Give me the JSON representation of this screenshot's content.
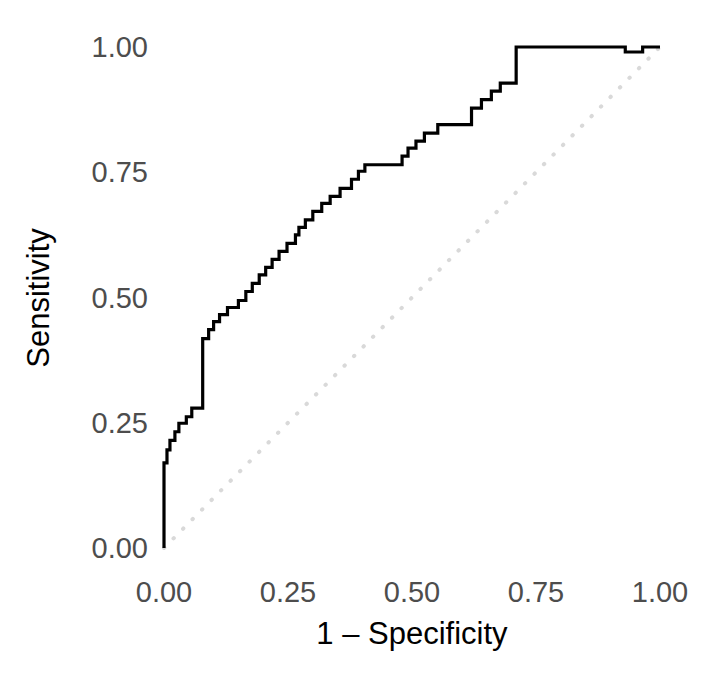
{
  "chart_data": {
    "type": "line",
    "title": "",
    "subtitle": "",
    "xlabel": "1 – Specificity",
    "ylabel": "Sensitivity",
    "xlim": [
      0,
      1
    ],
    "ylim": [
      0,
      1
    ],
    "grid": false,
    "legend": null,
    "xticks": [
      "0.00",
      "0.25",
      "0.50",
      "0.75",
      "1.00"
    ],
    "xtick_values": [
      0.0,
      0.25,
      0.5,
      0.75,
      1.0
    ],
    "yticks": [
      "0.00",
      "0.25",
      "0.50",
      "0.75",
      "1.00"
    ],
    "ytick_values": [
      0.0,
      0.25,
      0.5,
      0.75,
      1.0
    ],
    "annotations": [],
    "series": [
      {
        "name": "ROC curve",
        "style": "step",
        "color": "#000000",
        "linewidth": 3.2,
        "dash": "solid",
        "points": [
          [
            0.0,
            0.0
          ],
          [
            0.0,
            0.17
          ],
          [
            0.006,
            0.17
          ],
          [
            0.006,
            0.196
          ],
          [
            0.012,
            0.196
          ],
          [
            0.012,
            0.215
          ],
          [
            0.022,
            0.215
          ],
          [
            0.022,
            0.232
          ],
          [
            0.03,
            0.232
          ],
          [
            0.03,
            0.249
          ],
          [
            0.045,
            0.249
          ],
          [
            0.045,
            0.262
          ],
          [
            0.056,
            0.262
          ],
          [
            0.056,
            0.279
          ],
          [
            0.078,
            0.279
          ],
          [
            0.078,
            0.418
          ],
          [
            0.09,
            0.418
          ],
          [
            0.09,
            0.436
          ],
          [
            0.1,
            0.436
          ],
          [
            0.1,
            0.452
          ],
          [
            0.112,
            0.452
          ],
          [
            0.112,
            0.466
          ],
          [
            0.128,
            0.466
          ],
          [
            0.128,
            0.48
          ],
          [
            0.15,
            0.48
          ],
          [
            0.15,
            0.494
          ],
          [
            0.165,
            0.494
          ],
          [
            0.165,
            0.512
          ],
          [
            0.178,
            0.512
          ],
          [
            0.178,
            0.528
          ],
          [
            0.192,
            0.528
          ],
          [
            0.192,
            0.545
          ],
          [
            0.205,
            0.545
          ],
          [
            0.205,
            0.56
          ],
          [
            0.218,
            0.56
          ],
          [
            0.218,
            0.576
          ],
          [
            0.232,
            0.576
          ],
          [
            0.232,
            0.592
          ],
          [
            0.248,
            0.592
          ],
          [
            0.248,
            0.608
          ],
          [
            0.265,
            0.608
          ],
          [
            0.265,
            0.625
          ],
          [
            0.272,
            0.625
          ],
          [
            0.272,
            0.64
          ],
          [
            0.285,
            0.64
          ],
          [
            0.285,
            0.655
          ],
          [
            0.3,
            0.655
          ],
          [
            0.3,
            0.672
          ],
          [
            0.318,
            0.672
          ],
          [
            0.318,
            0.688
          ],
          [
            0.335,
            0.688
          ],
          [
            0.335,
            0.702
          ],
          [
            0.355,
            0.702
          ],
          [
            0.355,
            0.718
          ],
          [
            0.378,
            0.718
          ],
          [
            0.378,
            0.736
          ],
          [
            0.392,
            0.736
          ],
          [
            0.392,
            0.752
          ],
          [
            0.405,
            0.752
          ],
          [
            0.405,
            0.765
          ],
          [
            0.48,
            0.765
          ],
          [
            0.48,
            0.782
          ],
          [
            0.492,
            0.782
          ],
          [
            0.492,
            0.798
          ],
          [
            0.508,
            0.798
          ],
          [
            0.508,
            0.812
          ],
          [
            0.525,
            0.812
          ],
          [
            0.525,
            0.828
          ],
          [
            0.552,
            0.828
          ],
          [
            0.552,
            0.845
          ],
          [
            0.62,
            0.845
          ],
          [
            0.62,
            0.878
          ],
          [
            0.64,
            0.878
          ],
          [
            0.64,
            0.895
          ],
          [
            0.66,
            0.895
          ],
          [
            0.66,
            0.912
          ],
          [
            0.678,
            0.912
          ],
          [
            0.678,
            0.928
          ],
          [
            0.71,
            0.928
          ],
          [
            0.71,
            1.0
          ],
          [
            0.93,
            1.0
          ],
          [
            0.93,
            0.99
          ],
          [
            0.965,
            0.99
          ],
          [
            0.965,
            1.0
          ],
          [
            1.0,
            1.0
          ]
        ]
      },
      {
        "name": "chance reference line",
        "style": "line",
        "color": "#d9d9d9",
        "linewidth": 4,
        "dash": "dotted",
        "points": [
          [
            0.0,
            0.0
          ],
          [
            1.0,
            1.0
          ]
        ]
      }
    ]
  },
  "axes": {
    "x_tick_labels": [
      "0.00",
      "0.25",
      "0.50",
      "0.75",
      "1.00"
    ],
    "y_tick_labels": [
      "0.00",
      "0.25",
      "0.50",
      "0.75",
      "1.00"
    ],
    "x_axis_title": "1 – Specificity",
    "y_axis_title": "Sensitivity"
  },
  "colors": {
    "background": "#ffffff",
    "curve": "#000000",
    "reference": "#d9d9d9",
    "tick_text": "#4d4d4d",
    "axis_title_text": "#000000"
  }
}
